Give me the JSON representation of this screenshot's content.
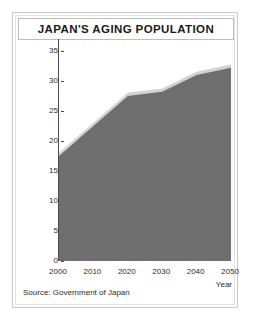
{
  "card": {
    "title": "JAPAN'S AGING POPULATION",
    "source": "Source: Government of Japan"
  },
  "colors": {
    "area_fill": "#6e6e6e",
    "area_edge": "#d2d2d2",
    "axis": "#4a4a4a",
    "frame": "#c9c9c9",
    "text": "#1a1a1a"
  },
  "chart_data": {
    "type": "area",
    "title": "JAPAN'S AGING POPULATION",
    "xlabel": "Year",
    "ylabel": "People over 65 as % of  total population",
    "x": [
      2000,
      2010,
      2020,
      2030,
      2040,
      2050
    ],
    "values": [
      17.5,
      22.5,
      27.5,
      28.2,
      31.0,
      32.2
    ],
    "series": [
      {
        "name": "People over 65 as % of total population",
        "values": [
          17.5,
          22.5,
          27.5,
          28.2,
          31.0,
          32.2
        ]
      }
    ],
    "xlim": [
      2000,
      2050
    ],
    "ylim": [
      0,
      35
    ],
    "xticks": [
      2000,
      2010,
      2020,
      2030,
      2040,
      2050
    ],
    "yticks": [
      0,
      5,
      10,
      15,
      20,
      25,
      30,
      35
    ],
    "xtick_labels": [
      "2000",
      "2010",
      "2020",
      "2030",
      "2040",
      "2050"
    ],
    "ytick_labels": [
      "0",
      "5",
      "10",
      "15",
      "20",
      "25",
      "30",
      "35"
    ],
    "grid": false,
    "legend": "none",
    "annotations": [
      "Source: Government of Japan"
    ]
  }
}
